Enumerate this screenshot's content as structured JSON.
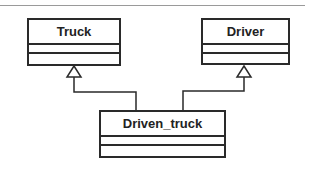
{
  "diagram": {
    "type": "UML class diagram",
    "classes": [
      {
        "id": "truck",
        "name": "Truck",
        "attributes": [],
        "operations": []
      },
      {
        "id": "driver",
        "name": "Driver",
        "attributes": [],
        "operations": []
      },
      {
        "id": "driven_truck",
        "name": "Driven_truck",
        "attributes": [],
        "operations": []
      }
    ],
    "relationships": [
      {
        "type": "generalization",
        "from": "Driven_truck",
        "to": "Truck"
      },
      {
        "type": "generalization",
        "from": "Driven_truck",
        "to": "Driver"
      }
    ]
  }
}
